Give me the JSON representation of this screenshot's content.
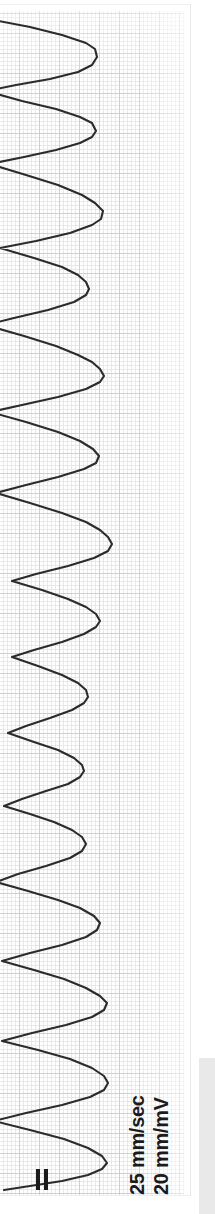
{
  "figure": {
    "number_label": "FIGURE 6-3",
    "band_color": "#e9e9e9",
    "number_text_color": "#fbfbfb"
  },
  "ecg": {
    "orientation": "rotated-90-ccw",
    "paper_speed": "25 mm/sec",
    "gain": "20 mm/mV",
    "lead_marker": "=",
    "trace_color": "#2b2b2b",
    "grid_major_color": "#c6c6ca",
    "grid_minor_color": "#e4e4e8",
    "grid_minor_size_px": 4,
    "grid_major_size_px": 20,
    "background_color": "#ffffff"
  },
  "chart_data": {
    "type": "line",
    "title": "",
    "xlabel": "",
    "ylabel": "",
    "grid": true,
    "legend": false,
    "axis_mapping": {
      "time_axis": "vertical (top = strip start)",
      "voltage_axis": "horizontal (right = baseline, left = positive deflection)"
    },
    "calibration": {
      "paper_speed_mm_per_sec": 25,
      "gain_mm_per_mV": 20,
      "small_box_px": 4,
      "large_box_px": 20
    },
    "series": [
      {
        "name": "ECG lead II",
        "path_d": "M -12 14 L 30 22 L 62 30 L 86 38 L 95 44 L 97 52 L 92 60 L 78 67 L 50 74 L 16 80 L -14 86 M -14 86 L 22 96 L 56 104 L 80 112 L 92 118 L 96 126 L 92 132 L 80 138 L 56 145 L 24 152 L -10 159 M -10 159 L 26 170 L 58 180 L 82 190 L 95 198 L 103 206 L 101 214 L 92 220 L 70 228 L 36 236 L 0 243 M 0 243 L 34 253 L 62 262 L 78 270 L 86 277 L 89 284 L 86 290 L 74 297 L 48 305 L 14 313 L -14 320 M -14 320 L 24 331 L 56 341 L 78 350 L 92 357 L 100 364 L 104 371 L 100 377 L 86 384 L 58 392 L 22 400 L -10 407 M -10 407 L 26 417 L 58 427 L 80 436 L 93 444 L 99 451 L 96 458 L 84 464 L 58 472 L 26 480 L -4 488 M -4 488 L 30 498 L 62 508 L 86 517 L 100 525 L 108 532 L 112 539 L 108 546 L 94 553 L 68 561 L 36 569 L 12 576 M 12 576 L 42 585 L 68 594 L 86 602 L 96 609 L 100 616 L 96 622 L 84 629 L 62 637 L 34 645 L 12 652 M 12 652 L 38 661 L 62 670 L 78 678 L 86 685 L 88 692 L 84 698 L 72 705 L 50 713 L 26 721 L 8 728 M 8 728 L 34 737 L 58 745 L 74 753 L 82 760 L 84 766 L 80 772 L 68 779 L 46 786 L 22 794 L 4 801 M 4 801 L 30 809 L 54 817 L 72 825 L 82 832 L 86 839 L 82 846 L 70 853 L 46 861 L 18 869 L -4 877 M -4 877 L 28 886 L 58 895 L 80 903 L 94 911 L 100 918 L 97 925 L 86 932 L 62 940 L 30 948 L 2 956 M 2 956 L 34 965 L 64 974 L 86 983 L 100 991 L 107 998 L 104 1005 L 92 1012 L 66 1020 L 32 1028 L 2 1036 M 2 1036 L 38 1045 L 70 1054 L 92 1063 L 104 1071 L 108 1078 L 104 1085 L 90 1092 L 62 1100 L 26 1108 L -6 1116 M -6 1116 L 30 1125 L 64 1134 L 88 1143 L 102 1151 L 107 1158 L 102 1164 L 88 1170 L 62 1176 L 30 1181 L 4 1185"
      }
    ]
  }
}
